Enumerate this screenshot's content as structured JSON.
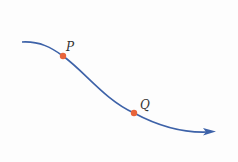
{
  "diagram": {
    "curve_color": "#3d62a8",
    "point_color": "#e8643a",
    "points": [
      {
        "label": "P",
        "x": 63,
        "y": 56
      },
      {
        "label": "Q",
        "x": 134,
        "y": 113
      }
    ]
  }
}
